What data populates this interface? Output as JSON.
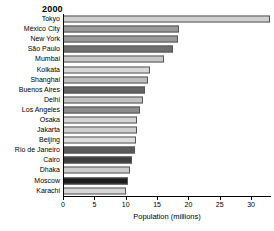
{
  "chart_data": {
    "type": "bar",
    "orientation": "horizontal",
    "title": "2000",
    "xlabel": "Population (millions)",
    "ylabel": "",
    "xlim": [
      0,
      33
    ],
    "xticks": [
      0,
      5,
      10,
      15,
      20,
      25,
      30
    ],
    "xticklabels": [
      "0",
      "5",
      "10",
      "15",
      "20",
      "25",
      "30"
    ],
    "grid": false,
    "legend": false,
    "categories": [
      "Tokyo",
      "México City",
      "New York",
      "São Paulo",
      "Mumbai",
      "Kolkata",
      "Shanghai",
      "Buenos Aires",
      "Delhi",
      "Los Angeles",
      "Osaka",
      "Jakarta",
      "Beijing",
      "Rio de Janeiro",
      "Cairo",
      "Dhaka",
      "Moscow",
      "Karachi"
    ],
    "values": [
      33.0,
      18.5,
      18.4,
      17.5,
      16.1,
      13.9,
      13.6,
      13.1,
      12.8,
      12.3,
      11.8,
      11.8,
      11.6,
      11.5,
      11.0,
      10.7,
      10.4,
      10.0
    ],
    "bar_colors": [
      "#d0d0d0",
      "#9a9a9a",
      "#9a9a9a",
      "#6e6e6e",
      "#c8c8c8",
      "#d8d8d8",
      "#bdbdbd",
      "#636363",
      "#c2c2c2",
      "#8b8b8b",
      "#d4d4d4",
      "#cfcfcf",
      "#dcdcdc",
      "#5a5a5a",
      "#3f3f3f",
      "#cdcdcd",
      "#1c1c1c",
      "#d6d6d6"
    ]
  }
}
